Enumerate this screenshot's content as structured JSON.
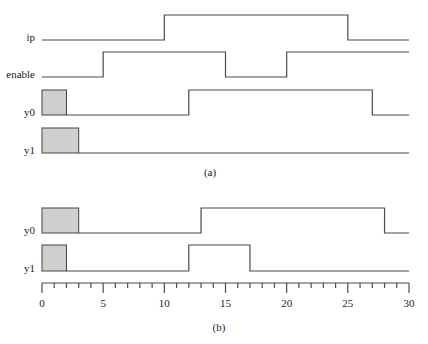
{
  "figure": {
    "type": "timing-diagram",
    "time_axis": {
      "min": 0,
      "max": 30,
      "major_step": 5,
      "minor_step": 1,
      "tick_labels": [
        "0",
        "5",
        "10",
        "15",
        "20",
        "25",
        "30"
      ]
    },
    "colors": {
      "line": "#4a4a4a",
      "unknown_fill": "#cfcfcf",
      "text": "#222222"
    },
    "panels": [
      {
        "caption": "(a)",
        "signals": [
          {
            "name": "ip",
            "unknown_until": 0,
            "initial": 0,
            "transitions": [
              10,
              25
            ]
          },
          {
            "name": "enable",
            "unknown_until": 0,
            "initial": 0,
            "transitions": [
              5,
              15,
              20
            ]
          },
          {
            "name": "y0",
            "unknown_until": 2,
            "initial": 0,
            "transitions": [
              12,
              27
            ]
          },
          {
            "name": "y1",
            "unknown_until": 3,
            "initial": 0,
            "transitions": []
          }
        ]
      },
      {
        "caption": "(b)",
        "signals": [
          {
            "name": "y0",
            "unknown_until": 3,
            "initial": 0,
            "transitions": [
              13,
              28
            ]
          },
          {
            "name": "y1",
            "unknown_until": 2,
            "initial": 0,
            "transitions": [
              12,
              17
            ]
          }
        ]
      }
    ]
  }
}
